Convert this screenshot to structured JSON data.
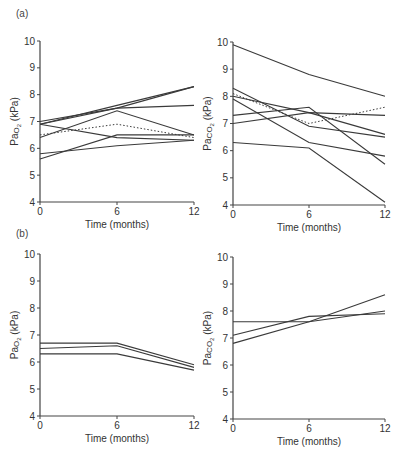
{
  "labels": {
    "panel_a": "(a)",
    "panel_b": "(b)"
  },
  "chart_data": [
    {
      "id": "a-left",
      "panel": "(a)",
      "type": "line",
      "xlabel": "Time (months)",
      "ylabel": "PaO2 (kPa)",
      "x": [
        0,
        6,
        12
      ],
      "xticks": [
        "0",
        "6",
        "12"
      ],
      "yticks": [
        "4",
        "5",
        "6",
        "7",
        "8",
        "9",
        "10"
      ],
      "ylim": [
        4,
        10
      ],
      "series": [
        {
          "name": "patient-1",
          "values": [
            6.9,
            7.6,
            8.3
          ],
          "style": "solid"
        },
        {
          "name": "patient-2",
          "values": [
            7.0,
            7.5,
            8.3
          ],
          "style": "solid"
        },
        {
          "name": "patient-3",
          "values": [
            6.9,
            7.5,
            7.6
          ],
          "style": "solid"
        },
        {
          "name": "patient-4",
          "values": [
            6.4,
            7.4,
            6.5
          ],
          "style": "solid"
        },
        {
          "name": "patient-5",
          "values": [
            6.9,
            6.4,
            6.3
          ],
          "style": "solid"
        },
        {
          "name": "patient-6",
          "values": [
            5.6,
            6.5,
            6.5
          ],
          "style": "solid"
        },
        {
          "name": "patient-7",
          "values": [
            5.8,
            6.1,
            6.3
          ],
          "style": "solid"
        },
        {
          "name": "mean",
          "values": [
            6.5,
            6.9,
            6.4
          ],
          "style": "dotted"
        }
      ]
    },
    {
      "id": "a-right",
      "panel": "(a)",
      "type": "line",
      "xlabel": "Time (months)",
      "ylabel": "PaCO2 (kPa)",
      "x": [
        0,
        6,
        12
      ],
      "xticks": [
        "0",
        "6",
        "12"
      ],
      "yticks": [
        "4",
        "5",
        "6",
        "7",
        "8",
        "9",
        "10"
      ],
      "ylim": [
        4,
        10
      ],
      "series": [
        {
          "name": "patient-1",
          "values": [
            9.9,
            8.8,
            8.0
          ],
          "style": "solid"
        },
        {
          "name": "patient-2",
          "values": [
            8.3,
            6.9,
            6.5
          ],
          "style": "solid"
        },
        {
          "name": "patient-3",
          "values": [
            8.0,
            7.4,
            6.6
          ],
          "style": "solid"
        },
        {
          "name": "patient-4",
          "values": [
            7.3,
            7.6,
            5.5
          ],
          "style": "solid"
        },
        {
          "name": "patient-5",
          "values": [
            7.0,
            7.4,
            7.3
          ],
          "style": "solid"
        },
        {
          "name": "patient-6",
          "values": [
            7.9,
            6.3,
            5.8
          ],
          "style": "solid"
        },
        {
          "name": "patient-7",
          "values": [
            6.3,
            6.1,
            4.1
          ],
          "style": "solid"
        },
        {
          "name": "mean",
          "values": [
            8.1,
            7.0,
            7.6
          ],
          "style": "dotted"
        }
      ]
    },
    {
      "id": "b-left",
      "panel": "(b)",
      "type": "line",
      "xlabel": "Time (months)",
      "ylabel": "PaO2 (kPa)",
      "x": [
        0,
        6,
        12
      ],
      "xticks": [
        "0",
        "6",
        "12"
      ],
      "yticks": [
        "4",
        "5",
        "6",
        "7",
        "8",
        "9",
        "10"
      ],
      "ylim": [
        4,
        10
      ],
      "series": [
        {
          "name": "patient-1",
          "values": [
            6.7,
            6.7,
            5.9
          ],
          "style": "solid"
        },
        {
          "name": "patient-2",
          "values": [
            6.5,
            6.6,
            5.8
          ],
          "style": "solid"
        },
        {
          "name": "patient-3",
          "values": [
            6.3,
            6.3,
            5.7
          ],
          "style": "solid"
        }
      ]
    },
    {
      "id": "b-right",
      "panel": "(b)",
      "type": "line",
      "xlabel": "Time (months)",
      "ylabel": "PaCO2 (kPa)",
      "x": [
        0,
        6,
        12
      ],
      "xticks": [
        "0",
        "6",
        "12"
      ],
      "yticks": [
        "4",
        "5",
        "6",
        "7",
        "8",
        "9",
        "10"
      ],
      "ylim": [
        4,
        10
      ],
      "series": [
        {
          "name": "patient-1",
          "values": [
            7.6,
            7.6,
            8.0
          ],
          "style": "solid"
        },
        {
          "name": "patient-2",
          "values": [
            7.1,
            7.8,
            7.9
          ],
          "style": "solid"
        },
        {
          "name": "patient-3",
          "values": [
            6.8,
            7.6,
            8.6
          ],
          "style": "solid"
        }
      ]
    }
  ]
}
